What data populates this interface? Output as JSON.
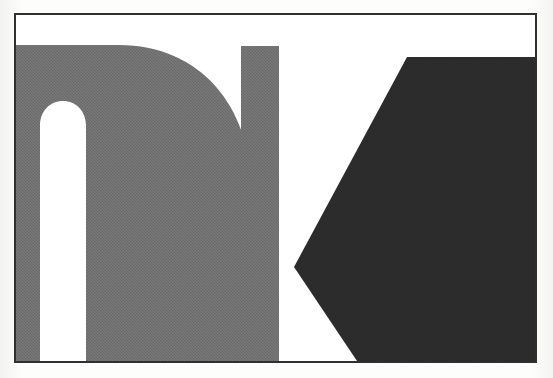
{
  "artwork": {
    "title": "nIK",
    "medium": "halftone printed graphic",
    "background_color": "#ffffff",
    "page_color": "#fbfbfa",
    "frame": {
      "stroke_color": "#2f2f2f",
      "stroke_width": 2,
      "x": 14,
      "y": 13,
      "width": 523,
      "height": 350
    },
    "letters": [
      {
        "glyph": "n",
        "name": "letter-n",
        "fill": "#6e6e6e",
        "description": "lowercase n, stem flush to left frame edge, arch rising to rounded shoulder, open white counter"
      },
      {
        "glyph": "I",
        "name": "letter-i-bar",
        "fill": "#6e6e6e",
        "description": "narrow vertical bar stem"
      },
      {
        "glyph": "K",
        "name": "letter-k-wedge",
        "fill": "#2a2a2a",
        "description": "dark angular hexagonal wedge reading as K, chevron point at left, bled off right edge"
      }
    ],
    "palette": {
      "light_gray": "#6e6e6e",
      "dark_charcoal": "#2a2a2a",
      "frame_ink": "#2f2f2f",
      "paper": "#ffffff"
    }
  }
}
